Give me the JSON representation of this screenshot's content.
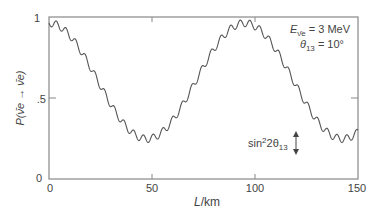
{
  "chart_data": {
    "type": "line",
    "title": "",
    "xlabel": "L/km",
    "ylabel": "P(ν̄e → ν̄e)",
    "xlim": [
      0,
      150
    ],
    "ylim": [
      0,
      1
    ],
    "x_ticks": [
      0,
      50,
      100,
      150
    ],
    "x_tick_labels": [
      "0",
      "50",
      "100",
      "150"
    ],
    "y_ticks": [
      0,
      0.5,
      1
    ],
    "y_tick_labels": [
      "0",
      ".5",
      "1"
    ],
    "grid": false,
    "legend": null,
    "annotations": [
      {
        "text": "E_ν̄e = 3 MeV",
        "position": "top-right"
      },
      {
        "text": "θ13 = 10°",
        "position": "top-right"
      },
      {
        "text": "sin²2θ13",
        "position": "right-middle",
        "with_arrow": "double vertical arrow indicating fast-oscillation amplitude"
      }
    ],
    "data_provenance": "synthetic",
    "data_provenance_note": "Series values are NOT measured from the image. They are regenerated from a hand-tuned model (slow oscillation with period ~95 km, min ~0.24 near L~48 km, plus a fast wiggle of amplitude ~0.045 and period ~4.7 km) chosen to visually match the drawn curve. Treat them as approximations of the plotted shape only. Text labels, tick values, and axis ranges are read directly from the image.",
    "model_parameters_fit_by_eye": {
      "slow_period_km": 95,
      "slow_depth": 0.715,
      "fast_wiggle_amplitude": 0.045,
      "fast_wiggle_period_km": 4.7
    },
    "series": [
      {
        "name": "P(ν̄e → ν̄e)",
        "color": "#555555",
        "style": "solid",
        "x": [
          0,
          5,
          10,
          15,
          20,
          25,
          30,
          35,
          40,
          45,
          48,
          50,
          55,
          60,
          65,
          70,
          75,
          80,
          85,
          90,
          95,
          100,
          105,
          110,
          115,
          120,
          125,
          130,
          135,
          140,
          145,
          150
        ],
        "y_approx": [
          0.95,
          0.93,
          0.84,
          0.73,
          0.59,
          0.47,
          0.37,
          0.29,
          0.25,
          0.24,
          0.24,
          0.24,
          0.26,
          0.32,
          0.41,
          0.52,
          0.64,
          0.76,
          0.86,
          0.93,
          0.95,
          0.92,
          0.84,
          0.72,
          0.59,
          0.46,
          0.36,
          0.28,
          0.25,
          0.24,
          0.26,
          0.31
        ]
      }
    ]
  },
  "labels": {
    "y_tick_1": "1",
    "y_tick_half": ".5",
    "y_tick_0": "0",
    "x_tick_0": "0",
    "x_tick_50": "50",
    "x_tick_100": "100",
    "x_tick_150": "150",
    "x_axis_label_italic": "L",
    "x_axis_label_unit": "/km",
    "y_axis_label": "P(ν̄e → ν̄e)",
    "energy_prefix": "E",
    "energy_sub": "ν̄e",
    "energy_value": " = 3 MeV",
    "theta_prefix": "θ",
    "theta_sub": "13",
    "theta_value": " = 10°",
    "sin_label_prefix": "sin",
    "sin_label_sup": "2",
    "sin_label_mid": "2θ",
    "sin_label_sub": "13"
  }
}
